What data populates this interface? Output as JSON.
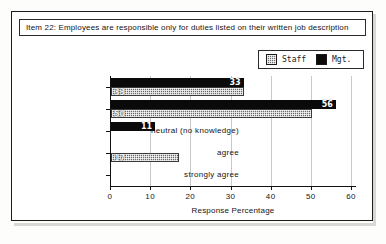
{
  "figure": {
    "title": "Item 22:  Employees are responsible only for duties listed on their written job description"
  },
  "legend": {
    "entries": [
      {
        "label": "Staff",
        "color": "#6f6f6f",
        "pattern": "dither-gray"
      },
      {
        "label": "Mgt.",
        "color": "#0b0b0b",
        "pattern": "solid-black"
      }
    ]
  },
  "chart_data": {
    "type": "bar",
    "orientation": "horizontal",
    "title": "Item 22:  Employees are responsible only for duties listed on their written job description",
    "xlabel": "Response Percentage",
    "ylabel": "",
    "xlim": [
      0,
      60
    ],
    "xticks": [
      "0",
      "10",
      "20",
      "30",
      "40",
      "50",
      "60"
    ],
    "grid": true,
    "legend_position": "top-right",
    "categories": [
      "strongly disagree",
      "disagree",
      "neutral (no knowledge)",
      "agree",
      "strongly agree"
    ],
    "series": [
      {
        "name": "Mgt.",
        "values": [
          33,
          56,
          11,
          0,
          0
        ],
        "color": "#0b0b0b"
      },
      {
        "name": "Staff",
        "values": [
          33,
          50,
          0,
          17,
          0
        ],
        "color": "#6f6f6f"
      }
    ],
    "data_labels": {
      "mgt": [
        "33",
        "56",
        "11",
        "",
        ""
      ],
      "staff": [
        "33",
        "50",
        "",
        "17",
        ""
      ]
    }
  }
}
